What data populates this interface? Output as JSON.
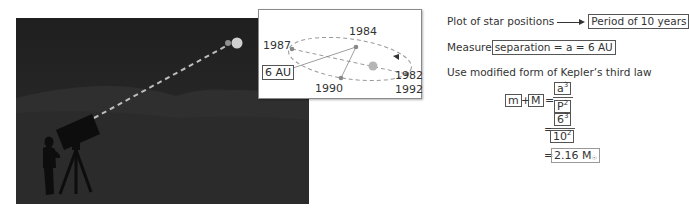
{
  "scene": {
    "description": "Observer with telescope viewing binary star under night sky",
    "colors": {
      "sky": "#262626",
      "line_of_sight": "#bdbdbd",
      "star_large": "#d4d4d4",
      "star_small": "#9a9a9a"
    }
  },
  "inset": {
    "years": {
      "y1987": "1987",
      "y1984": "1984",
      "y1990": "1990",
      "y1982": "1982",
      "y1992": "1992"
    },
    "separation_label": "6 AU"
  },
  "text": {
    "line1_prefix": "Plot of star positions",
    "line1_result": "Period of 10 years",
    "line2_prefix": "Measure",
    "line2_result": "separation = a = 6 AU",
    "line3": "Use modified form of Kepler’s third law"
  },
  "equation": {
    "m": "m",
    "plus": "+",
    "M": "M",
    "equals": "=",
    "num1_base": "a",
    "num1_exp": "3",
    "den1_base": "P",
    "den1_exp": "2",
    "num2_base": "6",
    "num2_exp": "3",
    "den2_base": "10",
    "den2_exp": "2",
    "result_value": "2.16 M",
    "result_sub": "☉"
  }
}
